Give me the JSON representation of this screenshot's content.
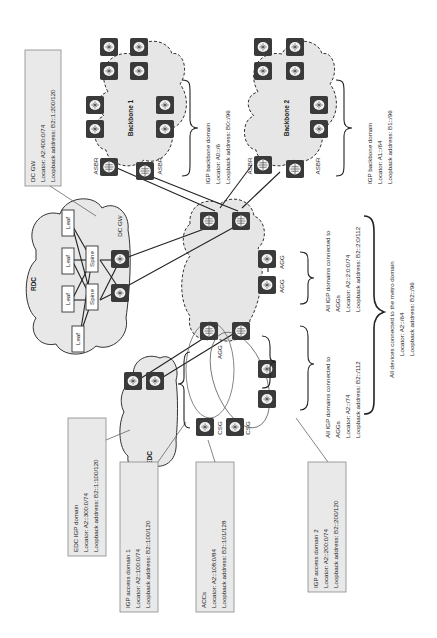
{
  "diagram": {
    "orientation": "rotated-90-ccw",
    "domains": {
      "rdc": {
        "label": "RDC"
      },
      "edc": {
        "label": "EDC"
      },
      "backbone1": {
        "label": "Backbone 1"
      },
      "backbone2": {
        "label": "Backbone 2"
      }
    },
    "rdc_nodes": {
      "leaf_label": "Leaf",
      "spine_label": "Spine",
      "dcgw_label": "DC GW"
    },
    "node_labels": {
      "asbr": "ASBR",
      "agg": "AGG",
      "csg": "CSG"
    },
    "callouts": {
      "dc_gw": {
        "title": "DC GW",
        "locator": "Locator: A2:400:0/74",
        "loopback": "Loopback address: B2::1:200/120"
      },
      "edc_igp": {
        "title": "EDC IGP domain",
        "locator": "Locator: A2::300:0/74",
        "loopback": "Loopback address: B2::1:100/120"
      },
      "igp_access_1": {
        "title": "IGP access domain 1",
        "locator": "Locator: A2::100:0/74",
        "loopback": "Loopback address: B2::100/120"
      },
      "accs": {
        "title": "ACCs",
        "locator": "Locator: A2::108:0/84",
        "loopback": "Loopback address: B2::101/128"
      },
      "igp_access_2": {
        "title": "IGP access domain 2",
        "locator": "Locator: A2::200:0/74",
        "loopback": "Loopback address: B2::200/120"
      }
    },
    "annotations": {
      "backbone1_igp": {
        "title": "IGP backbone domain",
        "locator": "Locator: A0::/6",
        "loopback": "Loopback address: B0::/96"
      },
      "backbone2_igp": {
        "title": "IGP backbone domain",
        "locator": "Locator: A1::/64",
        "loopback": "Loopback address: B1::/96"
      },
      "access_to_aggs": {
        "line1": "All IGP domains connected to",
        "line2": "AGGs",
        "locator": "Locator: A2::/74",
        "loopback": "Loopback address: B2::/112"
      },
      "aggs_domain": {
        "line1": "All IGP domains connected to",
        "line2": "AGGs",
        "locator": "Locator: A2::2:0:0/74",
        "loopback": "Loopback address: B2::2:0/112"
      },
      "metro": {
        "line1": "All devices connected to the metro domain",
        "locator": "Locator: A2::/64",
        "loopback": "Loopback address: B2::/96"
      }
    }
  }
}
